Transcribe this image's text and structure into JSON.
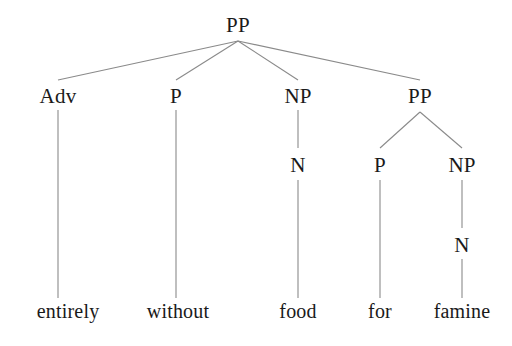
{
  "diagram": {
    "kind": "constituency-syntax-tree",
    "sentence": "entirely without food for famine",
    "colors": {
      "background": "#ffffff",
      "text": "#1a1a1a",
      "edge": "#8a8a8a"
    },
    "nodes": [
      {
        "id": "pp-root",
        "label": "PP",
        "x": 238,
        "y": 25,
        "level": 0,
        "type": "category"
      },
      {
        "id": "adv",
        "label": "Adv",
        "x": 58,
        "y": 96,
        "level": 1,
        "type": "category"
      },
      {
        "id": "p1",
        "label": "P",
        "x": 176,
        "y": 96,
        "level": 1,
        "type": "category"
      },
      {
        "id": "np1",
        "label": "NP",
        "x": 298,
        "y": 96,
        "level": 1,
        "type": "category"
      },
      {
        "id": "pp2",
        "label": "PP",
        "x": 420,
        "y": 96,
        "level": 1,
        "type": "category"
      },
      {
        "id": "n1",
        "label": "N",
        "x": 298,
        "y": 165,
        "level": 2,
        "type": "category"
      },
      {
        "id": "p2",
        "label": "P",
        "x": 380,
        "y": 165,
        "level": 2,
        "type": "category"
      },
      {
        "id": "np2",
        "label": "NP",
        "x": 462,
        "y": 165,
        "level": 2,
        "type": "category"
      },
      {
        "id": "n2",
        "label": "N",
        "x": 462,
        "y": 245,
        "level": 3,
        "type": "category"
      },
      {
        "id": "w-entirely",
        "label": "entirely",
        "x": 68,
        "y": 311,
        "level": 4,
        "type": "leaf"
      },
      {
        "id": "w-without",
        "label": "without",
        "x": 178,
        "y": 311,
        "level": 4,
        "type": "leaf"
      },
      {
        "id": "w-food",
        "label": "food",
        "x": 298,
        "y": 311,
        "level": 4,
        "type": "leaf"
      },
      {
        "id": "w-for",
        "label": "for",
        "x": 380,
        "y": 311,
        "level": 4,
        "type": "leaf"
      },
      {
        "id": "w-famine",
        "label": "famine",
        "x": 462,
        "y": 311,
        "level": 4,
        "type": "leaf"
      }
    ],
    "edges": [
      {
        "id": "e-root-adv",
        "from": "pp-root",
        "to": "adv",
        "x1": 238,
        "y1": 41,
        "x2": 58,
        "y2": 80
      },
      {
        "id": "e-root-p1",
        "from": "pp-root",
        "to": "p1",
        "x1": 238,
        "y1": 41,
        "x2": 176,
        "y2": 80
      },
      {
        "id": "e-root-np1",
        "from": "pp-root",
        "to": "np1",
        "x1": 238,
        "y1": 41,
        "x2": 298,
        "y2": 80
      },
      {
        "id": "e-root-pp2",
        "from": "pp-root",
        "to": "pp2",
        "x1": 238,
        "y1": 41,
        "x2": 420,
        "y2": 80
      },
      {
        "id": "e-adv-word",
        "from": "adv",
        "to": "w-entirely",
        "x1": 58,
        "y1": 110,
        "x2": 58,
        "y2": 298
      },
      {
        "id": "e-p1-word",
        "from": "p1",
        "to": "w-without",
        "x1": 176,
        "y1": 110,
        "x2": 176,
        "y2": 298
      },
      {
        "id": "e-np1-n1",
        "from": "np1",
        "to": "n1",
        "x1": 298,
        "y1": 110,
        "x2": 298,
        "y2": 148
      },
      {
        "id": "e-pp2-p2",
        "from": "pp2",
        "to": "p2",
        "x1": 420,
        "y1": 112,
        "x2": 380,
        "y2": 148
      },
      {
        "id": "e-pp2-np2",
        "from": "pp2",
        "to": "np2",
        "x1": 420,
        "y1": 112,
        "x2": 462,
        "y2": 148
      },
      {
        "id": "e-n1-word",
        "from": "n1",
        "to": "w-food",
        "x1": 298,
        "y1": 180,
        "x2": 298,
        "y2": 298
      },
      {
        "id": "e-p2-word",
        "from": "p2",
        "to": "w-for",
        "x1": 380,
        "y1": 180,
        "x2": 380,
        "y2": 298
      },
      {
        "id": "e-np2-n2",
        "from": "np2",
        "to": "n2",
        "x1": 462,
        "y1": 180,
        "x2": 462,
        "y2": 228
      },
      {
        "id": "e-n2-word",
        "from": "n2",
        "to": "w-famine",
        "x1": 462,
        "y1": 259,
        "x2": 462,
        "y2": 298
      }
    ]
  }
}
